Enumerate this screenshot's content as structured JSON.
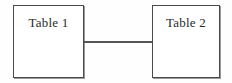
{
  "diagram": {
    "background_color": "#fefefe",
    "stroke_color": "#4a4a4a",
    "connector_color": "#555555",
    "text_color": "#2a2a2a",
    "nodes": [
      {
        "id": "table-1",
        "label": "Table 1",
        "shape": "rectangle",
        "x": 13,
        "y": 5,
        "width": 71,
        "height": 73
      },
      {
        "id": "table-2",
        "label": "Table 2",
        "shape": "rectangle",
        "x": 152,
        "y": 5,
        "width": 68,
        "height": 73
      }
    ],
    "edges": [
      {
        "id": "table-1-to-table-2",
        "label": "",
        "from": "table-1",
        "to": "table-2",
        "style": "solid",
        "x": 84,
        "y": 41,
        "length": 69,
        "thickness": 2
      }
    ]
  }
}
